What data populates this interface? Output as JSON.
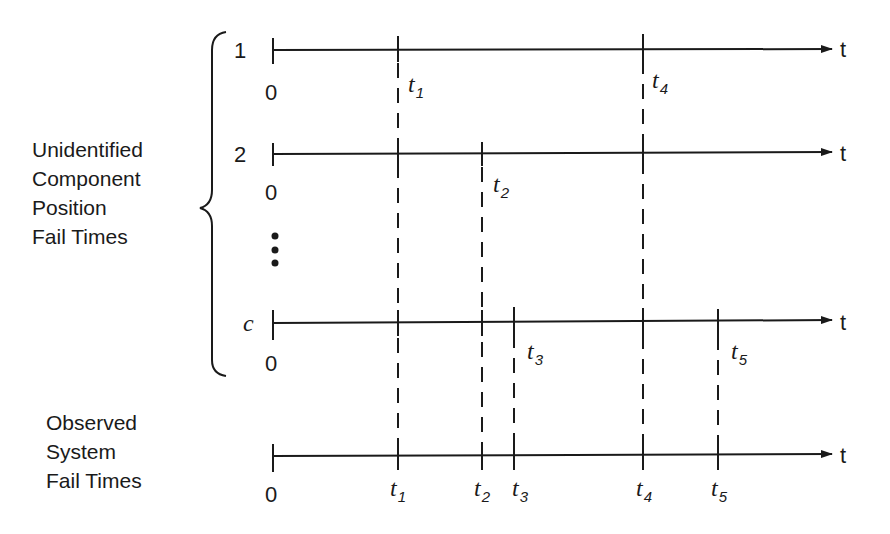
{
  "diagram": {
    "group_labels": {
      "unidentified": [
        "Unidentified",
        "Component",
        "Position",
        "Fail Times"
      ],
      "observed": [
        "Observed",
        "System",
        "Fail Times"
      ]
    },
    "axis_end_label": "t",
    "origin_label": "0",
    "rows": [
      {
        "id": "1",
        "label": "1",
        "fail_marks": [
          "t1",
          "t4"
        ],
        "labeled": [
          "t1",
          "t4"
        ]
      },
      {
        "id": "2",
        "label": "2",
        "fail_marks": [
          "t1",
          "t2",
          "t4"
        ],
        "labeled": [
          "t2"
        ]
      },
      {
        "id": "ellipsis",
        "label": "⋮"
      },
      {
        "id": "c",
        "label": "c",
        "fail_marks": [
          "t1",
          "t2",
          "t3",
          "t4",
          "t5"
        ],
        "labeled": [
          "t3",
          "t5"
        ]
      },
      {
        "id": "observed",
        "label": "",
        "fail_marks": [
          "t1",
          "t2",
          "t3",
          "t4",
          "t5"
        ],
        "labeled": [
          "t1",
          "t2",
          "t3",
          "t4",
          "t5"
        ]
      }
    ],
    "times": [
      {
        "name": "t",
        "sub": "1"
      },
      {
        "name": "t",
        "sub": "2"
      },
      {
        "name": "t",
        "sub": "3"
      },
      {
        "name": "t",
        "sub": "4"
      },
      {
        "name": "t",
        "sub": "5"
      }
    ]
  }
}
